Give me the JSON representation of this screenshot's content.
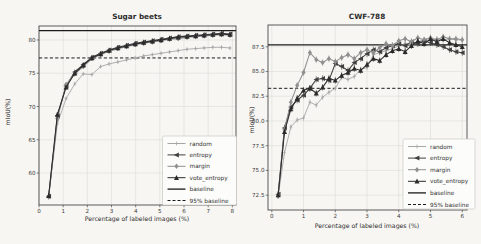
{
  "figure": {
    "background": "#f7f6f3",
    "text_color": "#2d2d2d",
    "grid_color": "#dcdbd7",
    "spine_color": "#4a4a4a"
  },
  "chart_data": [
    {
      "type": "line",
      "title": "Sugar beets",
      "xlabel": "Percentage of labeled images (%)",
      "ylabel": "mIoU(%)",
      "xlim": [
        0,
        8.15
      ],
      "ylim": [
        55.2,
        82.1
      ],
      "xticks": [
        0,
        1,
        2,
        3,
        4,
        5,
        6,
        7,
        8
      ],
      "xtick_labels": [
        "0",
        "1",
        "2",
        "3",
        "4",
        "5",
        "6",
        "7",
        "8"
      ],
      "yticks": [
        60,
        65,
        70,
        75,
        80
      ],
      "ytick_labels": [
        "60",
        "65",
        "70",
        "75",
        "80"
      ],
      "grid": true,
      "baseline_value": 81.4,
      "baseline95_value": 77.3,
      "legend_position": "lower right",
      "x": [
        0.4,
        0.76,
        1.12,
        1.48,
        1.83,
        2.19,
        2.55,
        2.9,
        3.26,
        3.62,
        3.98,
        4.33,
        4.69,
        5.05,
        5.4,
        5.76,
        6.12,
        6.48,
        6.83,
        7.19,
        7.55,
        7.9
      ],
      "series": [
        {
          "name": "random",
          "marker": "plus",
          "color": "#a6a6a6",
          "values": [
            56.5,
            67.4,
            71.2,
            73.4,
            74.9,
            74.8,
            76.0,
            76.4,
            76.7,
            77.0,
            77.3,
            77.6,
            77.8,
            78.0,
            78.2,
            78.4,
            78.6,
            78.7,
            78.8,
            78.9,
            78.9,
            78.8
          ]
        },
        {
          "name": "entropy",
          "marker": "tri-left",
          "color": "#404040",
          "values": [
            56.5,
            68.6,
            73.1,
            75.2,
            76.3,
            77.4,
            78.0,
            78.5,
            78.9,
            79.2,
            79.5,
            79.7,
            79.9,
            80.1,
            80.3,
            80.5,
            80.6,
            80.7,
            80.8,
            80.9,
            81.0,
            80.9
          ]
        },
        {
          "name": "margin",
          "marker": "diamond",
          "color": "#8f8f8f",
          "values": [
            56.4,
            68.2,
            73.3,
            74.9,
            76.0,
            77.2,
            77.8,
            78.3,
            78.7,
            79.0,
            79.3,
            79.5,
            79.7,
            79.9,
            80.1,
            80.2,
            80.4,
            80.5,
            80.6,
            80.7,
            80.8,
            80.7
          ]
        },
        {
          "name": "vote_entropy",
          "marker": "tri-up",
          "color": "#2b2b2b",
          "values": [
            56.6,
            68.8,
            72.9,
            75.0,
            76.2,
            77.3,
            77.9,
            78.4,
            78.8,
            79.1,
            79.4,
            79.6,
            79.8,
            80.0,
            80.2,
            80.4,
            80.5,
            80.6,
            80.7,
            80.8,
            80.9,
            80.8
          ]
        }
      ],
      "legend": [
        "random",
        "entropy",
        "margin",
        "vote_entropy",
        "baseline",
        "95% baseline"
      ]
    },
    {
      "type": "line",
      "title": "CWF-788",
      "xlabel": "Percentage of labeled images (%)",
      "ylabel": "mIoU(%)",
      "xlim": [
        -0.12,
        6.15
      ],
      "ylim": [
        71.0,
        89.7
      ],
      "xticks": [
        0,
        1,
        2,
        3,
        4,
        5,
        6
      ],
      "xtick_labels": [
        "0",
        "1",
        "2",
        "3",
        "4",
        "5",
        "6"
      ],
      "yticks": [
        72.5,
        75.0,
        77.5,
        80.0,
        82.5,
        85.0,
        87.5
      ],
      "ytick_labels": [
        "72.5",
        "75.0",
        "77.5",
        "80.0",
        "82.5",
        "85.0",
        "87.5"
      ],
      "grid": true,
      "baseline_value": 87.7,
      "baseline95_value": 83.3,
      "legend_position": "lower right",
      "x": [
        0.2,
        0.4,
        0.6,
        0.8,
        1.0,
        1.2,
        1.4,
        1.6,
        1.8,
        2.0,
        2.2,
        2.4,
        2.6,
        2.8,
        3.0,
        3.2,
        3.4,
        3.6,
        3.8,
        4.0,
        4.2,
        4.4,
        4.6,
        4.8,
        5.0,
        5.2,
        5.4,
        5.6,
        5.8,
        6.0
      ],
      "series": [
        {
          "name": "random",
          "marker": "plus",
          "color": "#a6a6a6",
          "values": [
            72.4,
            76.8,
            79.4,
            80.1,
            80.3,
            81.9,
            81.6,
            82.4,
            82.9,
            83.3,
            84.4,
            84.2,
            84.5,
            85.2,
            85.4,
            86.7,
            86.9,
            87.1,
            87.3,
            87.6,
            87.8,
            87.7,
            88.0,
            88.2,
            88.1,
            88.3,
            88.2,
            88.3,
            88.2,
            88.2
          ]
        },
        {
          "name": "entropy",
          "marker": "tri-left",
          "color": "#404040",
          "values": [
            72.6,
            79.3,
            81.4,
            82.1,
            82.6,
            83.3,
            84.2,
            84.3,
            84.1,
            85.8,
            85.5,
            85.1,
            85.9,
            86.3,
            86.8,
            87.2,
            87.0,
            87.4,
            87.6,
            87.8,
            87.6,
            88.0,
            87.8,
            88.1,
            87.9,
            87.7,
            87.5,
            87.2,
            87.0,
            86.9
          ]
        },
        {
          "name": "margin",
          "marker": "diamond",
          "color": "#8f8f8f",
          "values": [
            72.5,
            79.1,
            81.9,
            83.6,
            84.9,
            86.9,
            86.2,
            85.9,
            86.3,
            86.0,
            86.4,
            86.7,
            86.3,
            86.9,
            87.2,
            86.9,
            87.4,
            87.8,
            87.6,
            88.1,
            88.3,
            88.0,
            88.4,
            88.2,
            88.4,
            88.2,
            88.5,
            88.3,
            88.3,
            88.2
          ]
        },
        {
          "name": "vote_entropy",
          "marker": "tri-up",
          "color": "#2b2b2b",
          "values": [
            72.5,
            78.9,
            81.2,
            82.3,
            83.1,
            83.3,
            82.8,
            83.4,
            84.3,
            84.1,
            84.6,
            84.9,
            85.3,
            85.1,
            85.7,
            86.3,
            86.1,
            86.7,
            87.1,
            87.3,
            87.0,
            87.6,
            88.1,
            87.8,
            88.3,
            88.0,
            88.3,
            87.9,
            87.7,
            87.5
          ]
        }
      ],
      "legend": [
        "random",
        "entropy",
        "margin",
        "vote_entropy",
        "baseline",
        "95% baseline"
      ]
    }
  ]
}
